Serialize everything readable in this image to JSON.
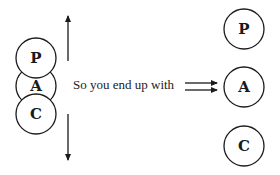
{
  "diagram": {
    "caption": "So you end up with",
    "left_stack": {
      "circles": [
        {
          "label": "P"
        },
        {
          "label": "A"
        },
        {
          "label": "C"
        }
      ],
      "arrows": [
        "up",
        "down"
      ]
    },
    "right_stack": {
      "circles": [
        {
          "label": "P"
        },
        {
          "label": "A"
        },
        {
          "label": "C"
        }
      ]
    },
    "colors": {
      "stroke": "#1a1a1a",
      "text": "#222222",
      "background": "#ffffff"
    }
  }
}
